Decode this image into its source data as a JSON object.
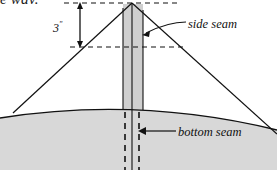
{
  "figure": {
    "kind": "tent-cross-section-diagram",
    "cut_off_text_top": "e way.",
    "labels": {
      "dimension": "3",
      "dimension_unit": "\"",
      "side_seam": "side seam",
      "bottom_seam": "bottom seam"
    },
    "colors": {
      "ink": "#111111",
      "ground_fill": "#d8d8d8",
      "column_fill": "#cfcfcf",
      "page": "#ffffff"
    },
    "geometry": {
      "apex": [
        132,
        3
      ],
      "left_edge_end": [
        13,
        113
      ],
      "right_edge_end": [
        277,
        134
      ],
      "column_left": 123,
      "column_right": 143,
      "column_center": 132,
      "dashed_top_y": 3,
      "dashed_mid_y": 47,
      "dim_arrow_x": 80,
      "ground_curve_peak_y": 108
    }
  }
}
